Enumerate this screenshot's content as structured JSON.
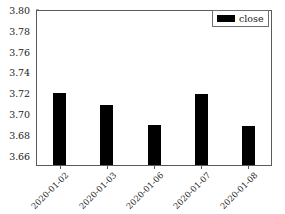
{
  "chart_data": {
    "type": "bar",
    "title": "",
    "xlabel": "",
    "ylabel": "",
    "categories": [
      "2020-01-02",
      "2020-01-03",
      "2020-01-06",
      "2020-01-07",
      "2020-01-08"
    ],
    "values": [
      3.72,
      3.709,
      3.689,
      3.7195,
      3.6885
    ],
    "series": [
      {
        "name": "close",
        "values": [
          3.72,
          3.709,
          3.689,
          3.7195,
          3.6885
        ],
        "color": "#000000"
      }
    ],
    "ylim": [
      3.65,
      3.8
    ],
    "yticks": [
      3.8,
      3.78,
      3.76,
      3.74,
      3.72,
      3.7,
      3.68,
      3.66
    ],
    "ytick_labels": [
      "3.80",
      "3.78",
      "3.76",
      "3.74",
      "3.72",
      "3.70",
      "3.68",
      "3.66"
    ],
    "grid": false,
    "legend": {
      "position": "upper right",
      "entries": [
        {
          "label": "close",
          "swatch_name": "legend-swatch-close",
          "color": "#000000"
        }
      ]
    },
    "xtick_rotation": -45,
    "bar_color": "#000000",
    "frame_color": "#5a5a5a",
    "background": "#ffffff"
  }
}
